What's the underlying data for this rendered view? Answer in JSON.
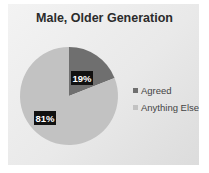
{
  "chart_data": {
    "type": "pie",
    "title": "Male, Older Generation",
    "categories": [
      "Agreed",
      "Anything Else"
    ],
    "values": [
      19,
      81
    ],
    "data_labels": [
      "19%",
      "81%"
    ],
    "colors": [
      "#6f6f6f",
      "#c2c2c2"
    ],
    "legend": {
      "position": "right",
      "entries": [
        "Agreed",
        "Anything Else"
      ]
    }
  }
}
